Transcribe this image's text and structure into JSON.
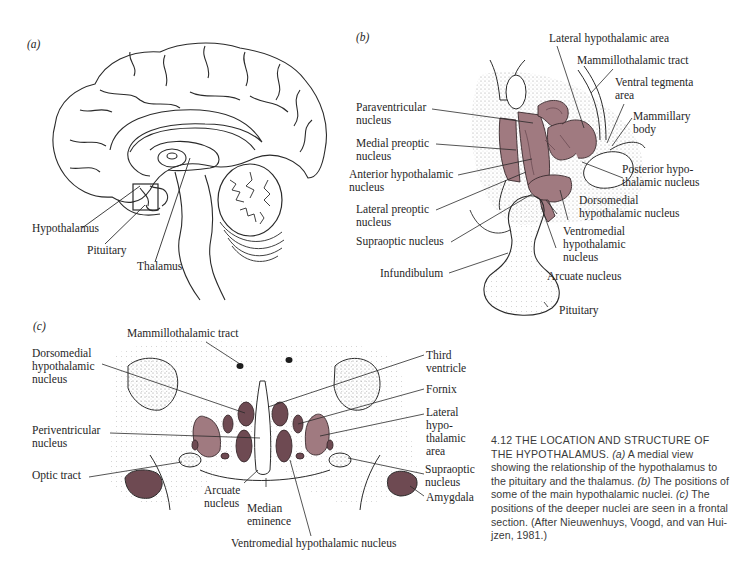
{
  "figure": {
    "number": "4.12",
    "colors": {
      "nucleus_fill": "#a07a80",
      "nucleus_dark": "#6e4a52",
      "line": "#2a2a2a",
      "stipple": "#9a9a9a"
    }
  },
  "panel_a": {
    "tag": "(a)",
    "labels": {
      "hypothalamus": "Hypothalamus",
      "pituitary": "Pituitary",
      "thalamus": "Thalamus"
    }
  },
  "panel_b": {
    "tag": "(b)",
    "labels": {
      "lateral_hypothalamic_area": "Lateral hypothalamic area",
      "mammillothalamic_tract": "Mammillothalamic tract",
      "ventral_tegmenta_1": "Ventral tegmenta",
      "ventral_tegmenta_2": "area",
      "mammillary_body_1": "Mammillary",
      "mammillary_body_2": "body",
      "paraventricular_1": "Paraventricular",
      "paraventricular_2": "nucleus",
      "medial_preoptic_1": "Medial preoptic",
      "medial_preoptic_2": "nucleus",
      "anterior_hypothalamic_1": "Anterior hypothalamic",
      "anterior_hypothalamic_2": "nucleus",
      "posterior_hypothalamic_1": "Posterior hypo-",
      "posterior_hypothalamic_2": "thalamic nucleus",
      "lateral_preoptic_1": "Lateral preoptic",
      "lateral_preoptic_2": "nucleus",
      "dorsomedial_1": "Dorsomedial",
      "dorsomedial_2": "hypothalamic nucleus",
      "supraoptic": "Supraoptic nucleus",
      "ventromedial_1": "Ventromedial",
      "ventromedial_2": "hypothalamic",
      "ventromedial_3": "nucleus",
      "infundibulum": "Infundibulum",
      "arcuate": "Arcuate nucleus",
      "pituitary": "Pituitary"
    }
  },
  "panel_c": {
    "tag": "(c)",
    "labels": {
      "mammillothalamic_tract": "Mammillothalamic tract",
      "dorsomedial_1": "Dorsomedial",
      "dorsomedial_2": "hypothalamic",
      "dorsomedial_3": "nucleus",
      "periventricular_1": "Periventricular",
      "periventricular_2": "nucleus",
      "optic_tract": "Optic tract",
      "arcuate_1": "Arcuate",
      "arcuate_2": "nucleus",
      "median_eminence_1": "Median",
      "median_eminence_2": "eminence",
      "ventromedial": "Ventromedial hypothalamic nucleus",
      "third_ventricle_1": "Third",
      "third_ventricle_2": "ventricle",
      "fornix": "Fornix",
      "lateral_area_1": "Lateral",
      "lateral_area_2": "hypo-",
      "lateral_area_3": "thalamic",
      "lateral_area_4": "area",
      "supraoptic_1": "Supraoptic",
      "supraoptic_2": "nucleus",
      "amygdala": "Amygdala"
    }
  },
  "caption": {
    "heading": "4.12  THE LOCATION AND STRUCTURE OF THE HYPOTHALAMUS.",
    "part_a_tag": "(a)",
    "part_a": " A medial view showing the relationship of the hypo­thalamus to the pituitary and the thalamus. ",
    "part_b_tag": "(b)",
    "part_b": " The positions of some of the main hypo­thalamic nuclei. ",
    "part_c_tag": "(c)",
    "part_c": " The positions of the deeper nuclei are seen in a frontal section. (After Nieuwenhuys, Voogd, and van Hui­jzen, 1981.)"
  }
}
